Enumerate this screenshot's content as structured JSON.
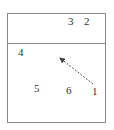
{
  "diagram": {
    "frame": {
      "x": 7,
      "y": 13,
      "width": 99,
      "height": 110,
      "stroke": "#888888"
    },
    "divider_y": 43,
    "labels": [
      {
        "id": "1",
        "text": "1",
        "x": 92,
        "y": 86
      },
      {
        "id": "2",
        "text": "2",
        "x": 84,
        "y": 16
      },
      {
        "id": "3",
        "text": "3",
        "x": 68,
        "y": 16
      },
      {
        "id": "4",
        "text": "4",
        "x": 18,
        "y": 47
      },
      {
        "id": "5",
        "text": "5",
        "x": 34,
        "y": 83
      },
      {
        "id": "6",
        "text": "6",
        "x": 66,
        "y": 85
      }
    ],
    "arrow": {
      "from": "1",
      "to": "near-4",
      "x1": 93,
      "y1": 84,
      "x2": 59,
      "y2": 57,
      "style": "dashed",
      "color": "#555555"
    }
  }
}
